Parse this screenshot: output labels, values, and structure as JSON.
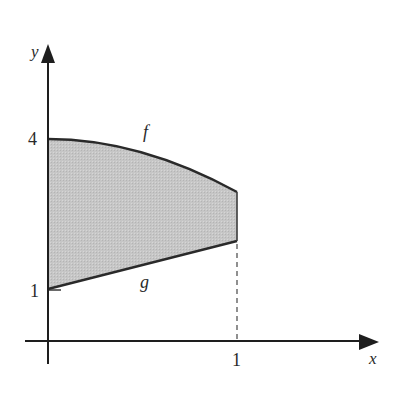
{
  "diagram": {
    "axes": {
      "x_label": "x",
      "y_label": "y",
      "x_ticks": [
        {
          "value": 1,
          "label": "1"
        }
      ],
      "y_ticks": [
        {
          "value": 1,
          "label": "1"
        },
        {
          "value": 4,
          "label": "4"
        }
      ]
    },
    "curves": [
      {
        "name": "f",
        "label": "f",
        "description": "decreasing concave-down curve from (0,4) to (1,~3)"
      },
      {
        "name": "g",
        "label": "g",
        "description": "increasing line from (0,1) to (1,~2)"
      }
    ],
    "region": {
      "description": "shaded region between f (top) and g (bottom) for 0 ≤ x ≤ 1",
      "fill_color": "#c8c8c8"
    },
    "colors": {
      "axis": "#1e1e1e",
      "curve": "#2a2a2a",
      "dashed_guide": "#555555"
    }
  }
}
